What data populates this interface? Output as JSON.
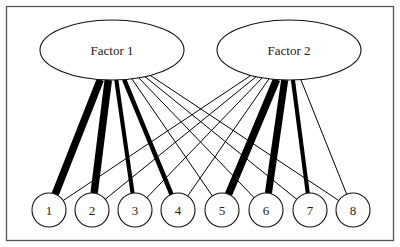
{
  "diagram": {
    "type": "factor-loading-path-diagram",
    "factors": [
      {
        "id": "F1",
        "label": "Factor 1"
      },
      {
        "id": "F2",
        "label": "Factor 2"
      }
    ],
    "indicators": [
      {
        "id": "1",
        "label": "1"
      },
      {
        "id": "2",
        "label": "2"
      },
      {
        "id": "3",
        "label": "3"
      },
      {
        "id": "4",
        "label": "4"
      },
      {
        "id": "5",
        "label": "5"
      },
      {
        "id": "6",
        "label": "6"
      },
      {
        "id": "7",
        "label": "7"
      },
      {
        "id": "8",
        "label": "8"
      }
    ],
    "edges": [
      {
        "from": "F1",
        "to": "1",
        "strength": "strong",
        "weight": 1.0
      },
      {
        "from": "F1",
        "to": "2",
        "strength": "strong",
        "weight": 1.0
      },
      {
        "from": "F1",
        "to": "3",
        "strength": "moderate",
        "weight": 0.55
      },
      {
        "from": "F1",
        "to": "4",
        "strength": "moderate",
        "weight": 0.6
      },
      {
        "from": "F1",
        "to": "5",
        "strength": "weak",
        "weight": 0.1
      },
      {
        "from": "F1",
        "to": "6",
        "strength": "weak",
        "weight": 0.1
      },
      {
        "from": "F1",
        "to": "7",
        "strength": "weak",
        "weight": 0.1
      },
      {
        "from": "F1",
        "to": "8",
        "strength": "weak",
        "weight": 0.1
      },
      {
        "from": "F2",
        "to": "1",
        "strength": "weak",
        "weight": 0.1
      },
      {
        "from": "F2",
        "to": "2",
        "strength": "weak",
        "weight": 0.1
      },
      {
        "from": "F2",
        "to": "3",
        "strength": "weak",
        "weight": 0.1
      },
      {
        "from": "F2",
        "to": "4",
        "strength": "weak",
        "weight": 0.1
      },
      {
        "from": "F2",
        "to": "5",
        "strength": "strong",
        "weight": 1.0
      },
      {
        "from": "F2",
        "to": "6",
        "strength": "strong",
        "weight": 0.95
      },
      {
        "from": "F2",
        "to": "7",
        "strength": "moderate",
        "weight": 0.55
      },
      {
        "from": "F2",
        "to": "8",
        "strength": "weak",
        "weight": 0.1
      }
    ],
    "colors": {
      "line": "#000000",
      "border": "#555555",
      "node_fill": "#ffffff"
    }
  }
}
